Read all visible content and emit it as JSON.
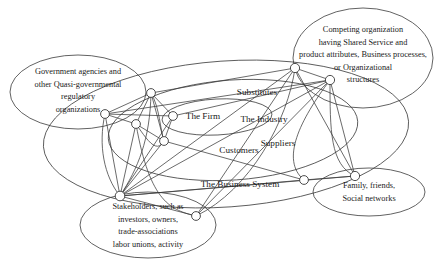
{
  "diagram": {
    "style": {
      "stroke": "#3a3a3a",
      "node_fill": "#ffffff",
      "background": "#ffffff"
    },
    "group_ellipses": [
      {
        "id": "government",
        "name": "government-agencies-ellipse",
        "cx": 78,
        "cy": 92,
        "rx": 68,
        "ry": 37,
        "rot": 0,
        "lines": [
          "Government agencies and",
          "other Quasi-governmental",
          "regulatory",
          "organizations"
        ],
        "text_x": 78,
        "text_y": 74,
        "line_height": 12.6
      },
      {
        "id": "competing",
        "name": "competing-organization-ellipse",
        "cx": 363,
        "cy": 58,
        "rx": 70,
        "ry": 50,
        "rot": 0,
        "lines": [
          "Competing organization",
          "having Shared Service and",
          "product attributes, Business processes,",
          "or Organizational",
          "structures"
        ],
        "text_x": 363,
        "text_y": 32,
        "line_height": 12.6
      },
      {
        "id": "stakeholders",
        "name": "stakeholders-ellipse",
        "cx": 148,
        "cy": 225,
        "rx": 68,
        "ry": 33,
        "rot": 0,
        "lines": [
          "Stakeholders, such as",
          "investors, owners,",
          "trade-associations",
          "labor unions, activity"
        ],
        "text_x": 148,
        "text_y": 209,
        "line_height": 12.6
      },
      {
        "id": "family",
        "name": "family-friends-ellipse",
        "cx": 369,
        "cy": 192,
        "rx": 56,
        "ry": 24,
        "rot": 0,
        "lines": [
          "Family, friends,",
          "Social networks"
        ],
        "text_x": 369,
        "text_y": 188,
        "line_height": 12.6
      }
    ],
    "concentric_ellipses": [
      {
        "id": "firm",
        "name": "the-firm-ellipse",
        "label": "The Firm",
        "cx": 217,
        "cy": 117,
        "rx": 55,
        "ry": 18,
        "rot": -3,
        "label_x": 203,
        "label_y": 119
      },
      {
        "id": "industry",
        "name": "the-industry-ellipse",
        "label": "The Industry",
        "cx": 233,
        "cy": 130,
        "rx": 125,
        "ry": 50,
        "rot": -4,
        "label_x": 264,
        "label_y": 122
      },
      {
        "id": "business-system",
        "name": "the-business-system-ellipse",
        "label": "The Business System",
        "cx": 226,
        "cy": 134,
        "rx": 183,
        "ry": 73,
        "rot": -4,
        "label_x": 240,
        "label_y": 187
      }
    ],
    "center_labels": [
      {
        "id": "substitutes",
        "name": "substitutes-label",
        "text": "Substitutes",
        "x": 257,
        "y": 95
      },
      {
        "id": "suppliers",
        "name": "suppliers-label",
        "text": "Suppliers",
        "x": 278,
        "y": 146
      },
      {
        "id": "customers",
        "name": "customers-label",
        "text": "Customers",
        "x": 239,
        "y": 153
      }
    ],
    "nodes": [
      {
        "id": "n1",
        "name": "node-government-link",
        "cx": 105,
        "cy": 114,
        "r": 4.4
      },
      {
        "id": "n2",
        "name": "node-firm-upper",
        "cx": 151,
        "cy": 93,
        "r": 4.4
      },
      {
        "id": "n3",
        "name": "node-firm-left",
        "cx": 136,
        "cy": 124,
        "r": 4.4
      },
      {
        "id": "n4",
        "name": "node-firm-center",
        "cx": 173,
        "cy": 116,
        "r": 4.4
      },
      {
        "id": "n5",
        "name": "node-firm-lower",
        "cx": 164,
        "cy": 141,
        "r": 4.4
      },
      {
        "id": "n6",
        "name": "node-stakeholder-hub",
        "cx": 120,
        "cy": 196,
        "r": 4.8
      },
      {
        "id": "n7",
        "name": "node-business-system-lower",
        "cx": 196,
        "cy": 216,
        "r": 4.4
      },
      {
        "id": "n8",
        "name": "node-competing-left",
        "cx": 295,
        "cy": 68,
        "r": 4.6
      },
      {
        "id": "n9",
        "name": "node-competing-right",
        "cx": 330,
        "cy": 80,
        "r": 4.6
      },
      {
        "id": "n10",
        "name": "node-customer-right",
        "cx": 304,
        "cy": 180,
        "r": 4.4
      },
      {
        "id": "n11",
        "name": "node-family-link",
        "cx": 355,
        "cy": 176,
        "r": 4.6
      }
    ],
    "links": [
      {
        "from": "n1",
        "to": "n4",
        "name": "link-government-firm"
      },
      {
        "from": "n1",
        "to": "n2",
        "name": "link-government-firm-upper"
      },
      {
        "from": "n1",
        "to": "n3",
        "name": "link-government-firm-left"
      },
      {
        "from": "n1",
        "to": "n6",
        "name": "link-government-stakeholders"
      },
      {
        "from": "n2",
        "to": "n3",
        "name": "link-upper-left"
      },
      {
        "from": "n2",
        "to": "n4",
        "name": "link-upper-center"
      },
      {
        "from": "n2",
        "to": "n5",
        "name": "link-upper-lower"
      },
      {
        "from": "n3",
        "to": "n5",
        "name": "link-left-lower"
      },
      {
        "from": "n3",
        "to": "n6",
        "name": "link-left-stakeholders"
      },
      {
        "from": "n4",
        "to": "n5",
        "name": "link-center-lower"
      },
      {
        "from": "n4",
        "to": "n6",
        "name": "link-center-stakeholders"
      },
      {
        "from": "n5",
        "to": "n6",
        "name": "link-lower-stakeholders"
      },
      {
        "from": "n5",
        "to": "n10",
        "name": "link-lower-customer"
      },
      {
        "from": "n6",
        "to": "n7",
        "name": "link-stakeholders-bs"
      },
      {
        "from": "n6",
        "to": "n8",
        "name": "link-stakeholders-competing-left"
      },
      {
        "from": "n6",
        "to": "n9",
        "name": "link-stakeholders-competing-right"
      },
      {
        "from": "n6",
        "to": "n10",
        "name": "link-stakeholders-customer"
      },
      {
        "from": "n6",
        "to": "n11",
        "name": "link-stakeholders-family"
      },
      {
        "from": "n1",
        "to": "n9",
        "name": "link-government-competing"
      },
      {
        "from": "n7",
        "to": "n8",
        "name": "link-bs-competing-left"
      },
      {
        "from": "n7",
        "to": "n9",
        "name": "link-bs-competing-right"
      },
      {
        "from": "n8",
        "to": "n9",
        "name": "link-competing-pair"
      },
      {
        "from": "n8",
        "to": "n11",
        "name": "link-competing-left-family"
      },
      {
        "from": "n9",
        "to": "n11",
        "name": "link-competing-right-family"
      },
      {
        "from": "n10",
        "to": "n11",
        "name": "link-customer-family"
      },
      {
        "from": "n4",
        "to": "n9",
        "name": "link-firm-competing"
      },
      {
        "from": "n2",
        "to": "n8",
        "name": "link-upper-competing"
      }
    ],
    "curved_links": [
      {
        "name": "curve-firm-upper-arc",
        "d": "M151,93 C160,108 160,130 164,141"
      },
      {
        "name": "curve-left-arc",
        "d": "M136,124 C146,138 156,155 164,141"
      },
      {
        "name": "curve-stakeholder-arc",
        "d": "M120,196 C138,168 150,140 151,93"
      },
      {
        "name": "curve-outer-left",
        "d": "M105,114 C98,145 104,176 120,196"
      },
      {
        "name": "curve-bs-bottom",
        "d": "M196,216 C172,210 150,204 136,124"
      },
      {
        "name": "curve-competing-down",
        "d": "M295,68 C288,120 250,190 196,216"
      },
      {
        "name": "curve-competing-down2",
        "d": "M330,80 C330,130 330,165 355,176"
      },
      {
        "name": "curve-right-sweep",
        "d": "M330,80 C300,120 280,160 304,180"
      }
    ]
  }
}
